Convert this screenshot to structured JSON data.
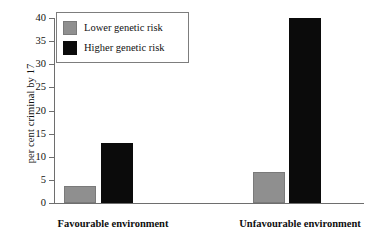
{
  "chart_data": {
    "type": "bar",
    "title": "",
    "xlabel": "",
    "ylabel": "per cent criminal by 17",
    "categories": [
      "Favourable environment",
      "Unfavourable environment"
    ],
    "series": [
      {
        "name": "Lower genetic risk",
        "color": "#8f8f8f",
        "values": [
          3.7,
          6.7
        ]
      },
      {
        "name": "Higher genetic risk",
        "color": "#0b0b0b",
        "values": [
          13.0,
          40.0
        ]
      }
    ],
    "ylim": [
      0,
      40
    ],
    "ytick_step": 5,
    "yticks": [
      "40",
      "35",
      "30",
      "25",
      "20",
      "15",
      "10",
      "5",
      "0"
    ],
    "grid": false,
    "legend_position": "top-left"
  },
  "legend": {
    "items": [
      {
        "label": "Lower genetic risk"
      },
      {
        "label": "Higher genetic risk"
      }
    ]
  }
}
